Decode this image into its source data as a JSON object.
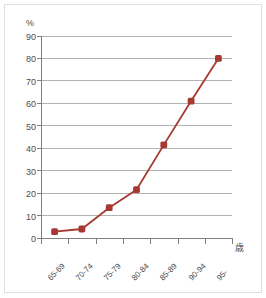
{
  "chart_data": {
    "type": "line",
    "title": "",
    "subtitle": "",
    "xlabel": "歳",
    "ylabel": "%",
    "categories": [
      "65-69",
      "70-74",
      "75-79",
      "80-84",
      "85-89",
      "90-94",
      "95-"
    ],
    "values": [
      2.8,
      4.0,
      13.5,
      21.5,
      41.5,
      61.0,
      80.0
    ],
    "series": [
      {
        "name": "",
        "values": [
          2.8,
          4.0,
          13.5,
          21.5,
          41.5,
          61.0,
          80.0
        ],
        "color": "#A63A32",
        "marker": "square-diamond"
      }
    ],
    "ylim": [
      0,
      90
    ],
    "ytick_labels": [
      "0",
      "10",
      "20",
      "30",
      "40",
      "50",
      "60",
      "70",
      "80",
      "90"
    ],
    "ytick_values": [
      0,
      10,
      20,
      30,
      40,
      50,
      60,
      70,
      80,
      90
    ],
    "xtick_labels": [
      "65-69",
      "70-74",
      "75-79",
      "80-84",
      "85-89",
      "90-94",
      "95-"
    ],
    "grid": "horizontal",
    "legend": "none",
    "legend_position": "none",
    "annotations": []
  },
  "colors": {
    "series": "#A63A32",
    "gridline": "#b3b3b3",
    "axis": "#808080",
    "tick_text": "#4d4d4d",
    "frame": "#e2dede",
    "background": "#ffffff"
  }
}
